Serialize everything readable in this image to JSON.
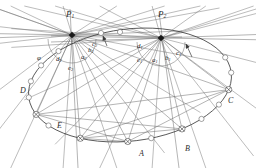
{
  "figure": {
    "background": "#ffffff",
    "line_color": "#4a4a4a",
    "curve_color": "#3a3a3a",
    "label_color": "#2b2b2b"
  },
  "hub_labels": [
    {
      "name": "P1",
      "base": "P",
      "sub": "1",
      "x": 66,
      "y": 10
    },
    {
      "name": "P2",
      "base": "P",
      "sub": "2",
      "x": 158,
      "y": 10
    }
  ],
  "vertex_labels": [
    {
      "name": "A",
      "base": "A",
      "sub": "",
      "x": 139,
      "y": 150
    },
    {
      "name": "B",
      "base": "B",
      "sub": "",
      "x": 185,
      "y": 145
    },
    {
      "name": "C",
      "base": "C",
      "sub": "",
      "x": 228,
      "y": 97
    },
    {
      "name": "D",
      "base": "D",
      "sub": "",
      "x": 20,
      "y": 87
    },
    {
      "name": "E",
      "base": "E",
      "sub": "",
      "x": 57,
      "y": 122
    }
  ],
  "angle_labels": [
    {
      "name": "a1",
      "base": "a",
      "sub": "1",
      "x": 152,
      "y": 57
    },
    {
      "name": "b1",
      "base": "b",
      "sub": "1",
      "x": 165,
      "y": 55
    },
    {
      "name": "c1",
      "base": "c",
      "sub": "1",
      "x": 176,
      "y": 50
    },
    {
      "name": "d1",
      "base": "d",
      "sub": "1",
      "x": 137,
      "y": 43
    },
    {
      "name": "e1",
      "base": "e",
      "sub": "1",
      "x": 137,
      "y": 57
    },
    {
      "name": "a2",
      "base": "a",
      "sub": "2",
      "x": 81,
      "y": 54
    },
    {
      "name": "b2",
      "base": "b",
      "sub": "2",
      "x": 88,
      "y": 47
    },
    {
      "name": "c2",
      "base": "c",
      "sub": "2",
      "x": 92,
      "y": 41
    },
    {
      "name": "d2",
      "base": "d",
      "sub": "2",
      "x": 56,
      "y": 56
    },
    {
      "name": "e2",
      "base": "e",
      "sub": "2",
      "x": 68,
      "y": 65
    },
    {
      "name": "phi",
      "base": "φ",
      "sub": "",
      "x": 37,
      "y": 55
    }
  ],
  "ellipse": {
    "cx": 130,
    "cy": 85,
    "rx": 102,
    "ry": 56,
    "rotation_deg": -7,
    "marker_count": 22,
    "marker_radius": 2.6
  },
  "hubs": [
    {
      "name": "P1",
      "x": 72,
      "y": 35,
      "ray_count": 18
    },
    {
      "name": "P2",
      "x": 161,
      "y": 38,
      "ray_count": 18
    }
  ],
  "arrows": [
    {
      "name": "arrow-left",
      "x1": 107,
      "y1": 46,
      "x2": 103,
      "y2": 36
    },
    {
      "name": "arrow-right",
      "x1": 192,
      "y1": 57,
      "x2": 186,
      "y2": 44
    }
  ],
  "arcs": [
    {
      "name": "arc-p2-angles",
      "cx": 161,
      "cy": 38,
      "r": 24
    },
    {
      "name": "arc-p1-angles",
      "cx": 72,
      "cy": 35,
      "r": 24
    }
  ]
}
